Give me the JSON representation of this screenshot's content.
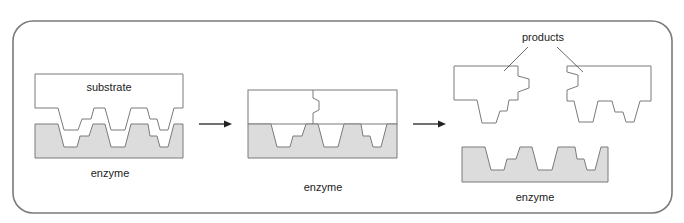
{
  "figure": {
    "colors": {
      "frame": "#7a7a7a",
      "outline": "#7a7a7a",
      "enzyme_fill": "#dcdcdc",
      "arrow": "#222222",
      "text": "#222222"
    },
    "panels": [
      {
        "id": "bound",
        "labels": {
          "substrate": "substrate",
          "enzyme": "enzyme"
        }
      },
      {
        "id": "cleaving",
        "labels": {
          "enzyme": "enzyme"
        }
      },
      {
        "id": "released",
        "labels": {
          "products": "products",
          "enzyme": "enzyme"
        }
      }
    ],
    "arrows": [
      {
        "from": "bound",
        "to": "cleaving",
        "icon": "right-arrow-icon"
      },
      {
        "from": "cleaving",
        "to": "released",
        "icon": "right-arrow-icon"
      }
    ]
  }
}
